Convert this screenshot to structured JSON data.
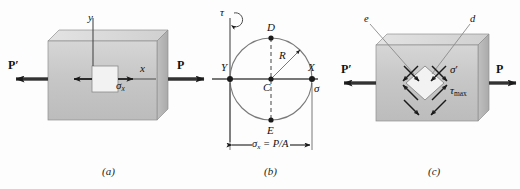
{
  "figure": {
    "background_color": "#fdfdfd",
    "ink_color": "#1a1a1a",
    "block_face_color": "#c9c9c9",
    "block_top_color": "#dcdcdc",
    "block_side_color": "#b4b4b4",
    "element_color": "#f0f0f0"
  },
  "panels": [
    {
      "id": "a",
      "caption": "(a)",
      "labels": {
        "axis_y": "y",
        "axis_x": "x",
        "stress": "σ",
        "stress_sub": "x",
        "force_left": "P",
        "force_left_prime": "′",
        "force_right": "P"
      }
    },
    {
      "id": "b",
      "caption": "(b)",
      "labels": {
        "axis_tau": "τ",
        "axis_sigma": "σ",
        "point_top": "D",
        "point_bottom": "E",
        "point_center": "C",
        "point_right": "X",
        "point_left": "Y",
        "radius": "R",
        "dimension": "σ",
        "dimension_sub": "x",
        "dimension_rest": " = P/A"
      }
    },
    {
      "id": "c",
      "caption": "(c)",
      "labels": {
        "plane_e": "e",
        "plane_d": "d",
        "normal_stress": "σ",
        "normal_stress_prime": "′",
        "shear_stress": "τ",
        "shear_stress_sub": "max",
        "force_left": "P",
        "force_left_prime": "′",
        "force_right": "P"
      }
    }
  ]
}
